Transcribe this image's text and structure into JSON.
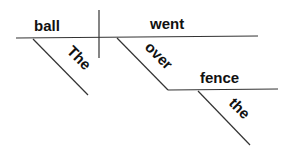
{
  "diagram": {
    "type": "sentence-diagram",
    "subject": "ball",
    "verb": "went",
    "subject_modifier": "The",
    "preposition": "over",
    "object_of_preposition": "fence",
    "object_modifier": "the"
  }
}
